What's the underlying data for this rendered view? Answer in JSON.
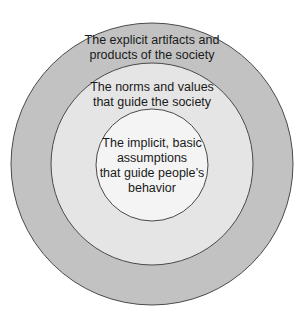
{
  "diagram": {
    "type": "concentric-circles",
    "layers": [
      {
        "name": "outer",
        "lines": [
          "The explicit artifacts and",
          "products of the society"
        ],
        "fill": "#c2c2c2"
      },
      {
        "name": "middle",
        "lines": [
          "The norms and values",
          "that guide the society"
        ],
        "fill": "#e5e5e5"
      },
      {
        "name": "inner",
        "lines": [
          "The implicit, basic",
          "assumptions",
          "that guide people’s",
          "behavior"
        ],
        "fill": "#f4f4f4"
      }
    ],
    "stroke": "#4a4a4a"
  }
}
